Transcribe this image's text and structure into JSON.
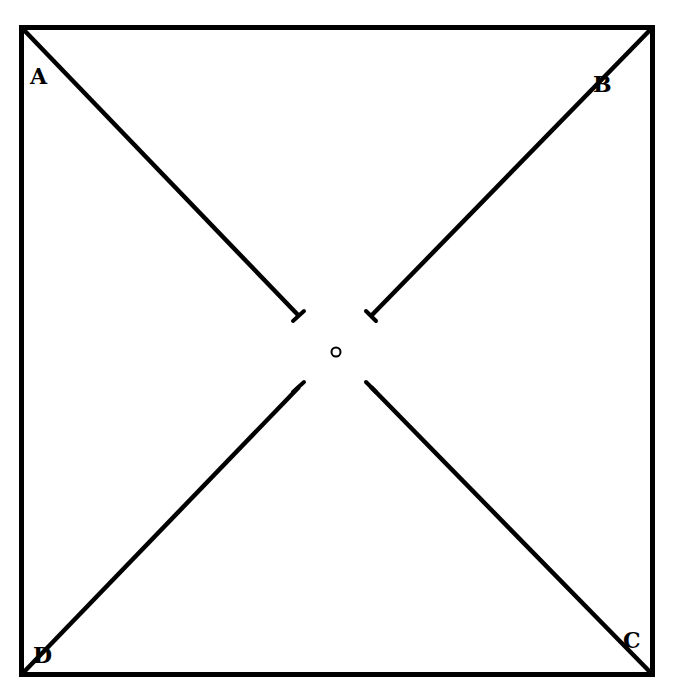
{
  "diagram": {
    "type": "square-with-diagonals",
    "stroke_color": "#000000",
    "background": "#ffffff",
    "corners": [
      {
        "label": "A",
        "position": "top-left"
      },
      {
        "label": "B",
        "position": "top-right"
      },
      {
        "label": "C",
        "position": "bottom-right"
      },
      {
        "label": "D",
        "position": "bottom-left"
      }
    ],
    "center_marker": "o",
    "segments": [
      {
        "from": "A",
        "to": "center",
        "gap_end": true
      },
      {
        "from": "B",
        "to": "center",
        "gap_end": true
      },
      {
        "from": "C",
        "to": "center",
        "gap_end": true
      },
      {
        "from": "D",
        "to": "center",
        "gap_end": true
      }
    ]
  }
}
